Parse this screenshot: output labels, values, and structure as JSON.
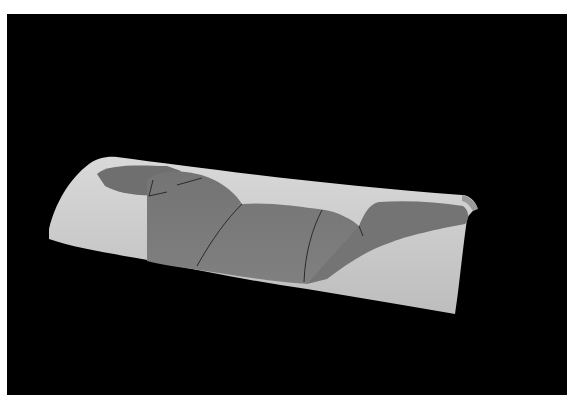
{
  "image": {
    "subject": "Fragmented curved ceramic roof tile reassembled, photographed on black background",
    "alt": "Curved roof tile reconstructed from dark grey fragments filled in with light plaster",
    "colors": {
      "background": "#000000",
      "border": "#ffffff",
      "plaster": "#c9c9c9",
      "plaster_highlight": "#dedede",
      "fragment": "#7a7a7a",
      "fragment_dark": "#6a6a6a",
      "crack": "#2a2a2a"
    }
  }
}
